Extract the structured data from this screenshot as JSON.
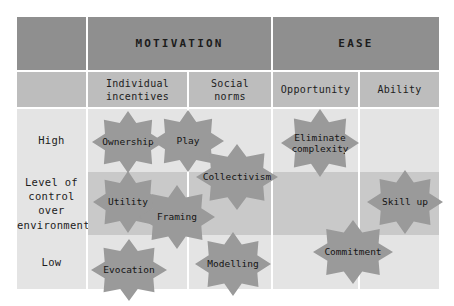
{
  "diagram": {
    "colors": {
      "header_dark": "#8f8f8f",
      "header_mid": "#bdbdbd",
      "body_light": "#e4e4e4",
      "body_band": "#c9c9c9",
      "star_fill": "#9a9a9a",
      "grid_line": "#ffffff",
      "text": "#1c1c1c"
    },
    "top_headers": [
      {
        "label": "MOTIVATION"
      },
      {
        "label": "EASE"
      }
    ],
    "column_headers": [
      {
        "label": "Individual\nincentives"
      },
      {
        "label": "Social\nnorms"
      },
      {
        "label": "Opportunity"
      },
      {
        "label": "Ability"
      }
    ],
    "row_headers": [
      {
        "label": "High"
      },
      {
        "label": "Level of\ncontrol\nover\nenvironment"
      },
      {
        "label": "Low"
      }
    ],
    "corner_label": "",
    "stars": [
      {
        "label": "Ownership",
        "column": "Individual incentives",
        "row": "High"
      },
      {
        "label": "Play",
        "column": "Individual incentives",
        "row": "High"
      },
      {
        "label": "Collectivism",
        "column": "Social norms",
        "row": "High"
      },
      {
        "label": "Eliminate\ncomplexity",
        "column": "Opportunity",
        "row": "High"
      },
      {
        "label": "Utility",
        "column": "Individual incentives",
        "row": "Level of control over environment"
      },
      {
        "label": "Framing",
        "column": "Individual incentives",
        "row": "Level of control over environment"
      },
      {
        "label": "Skill up",
        "column": "Ability",
        "row": "Level of control over environment"
      },
      {
        "label": "Evocation",
        "column": "Individual incentives",
        "row": "Low"
      },
      {
        "label": "Modelling",
        "column": "Social norms",
        "row": "Low"
      },
      {
        "label": "Commitment",
        "column": "Opportunity",
        "row": "Low"
      }
    ]
  }
}
